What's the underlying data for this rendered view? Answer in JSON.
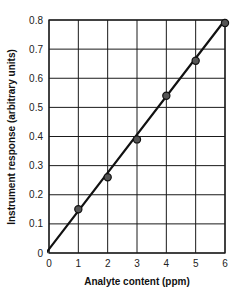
{
  "chart_data": {
    "type": "scatter",
    "title": "",
    "xlabel": "Analyte content (ppm)",
    "ylabel": "Instrument response (arbitrary units)",
    "xlim": [
      0,
      6
    ],
    "ylim": [
      0,
      0.8
    ],
    "x_ticks": [
      "0",
      "1",
      "2",
      "3",
      "4",
      "5",
      "6"
    ],
    "y_ticks": [
      "0",
      "0.1",
      "0.2",
      "0.3",
      "0.4",
      "0.5",
      "0.6",
      "0.7",
      "0.8"
    ],
    "grid": true,
    "legend": null,
    "series": [
      {
        "name": "Calibration standards",
        "type": "scatter",
        "x": [
          1,
          2,
          3,
          4,
          5,
          6
        ],
        "y": [
          0.15,
          0.26,
          0.39,
          0.54,
          0.66,
          0.79
        ]
      },
      {
        "name": "Calibration line (linear fit)",
        "type": "line",
        "x": [
          -0.1,
          6
        ],
        "y": [
          0.0,
          0.8
        ]
      }
    ]
  },
  "colors": {
    "grid": "#1a1a1a",
    "line": "#111111",
    "marker_fill": "#555555",
    "marker_edge": "#111111",
    "background": "#ffffff"
  }
}
